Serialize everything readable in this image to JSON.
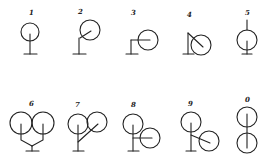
{
  "diagram": {
    "stroke_color": "#222222",
    "background": "#ffffff",
    "figures": [
      {
        "label": "1",
        "row": 1,
        "variant": "single circle, vertical stem from center to base"
      },
      {
        "label": "2",
        "row": 1,
        "variant": "single circle offset upper-right, angled arm to stem"
      },
      {
        "label": "3",
        "row": 1,
        "variant": "single circle offset right, horizontal arm to stem"
      },
      {
        "label": "4",
        "row": 1,
        "variant": "single circle lower-right, diagonal arm from top of stem"
      },
      {
        "label": "5",
        "row": 1,
        "variant": "single circle with stem above and below"
      },
      {
        "label": "6",
        "row": 2,
        "variant": "two circles side by side, Y-shaped stems joining to base"
      },
      {
        "label": "7",
        "row": 2,
        "variant": "two circles, right one on angled arm from main stem"
      },
      {
        "label": "8",
        "row": 2,
        "variant": "two circles, lower-right one on horizontal arm"
      },
      {
        "label": "9",
        "row": 2,
        "variant": "two circles, lower-right one on diagonal arm"
      },
      {
        "label": "0",
        "row": 2,
        "variant": "two circles stacked vertically on shared axis"
      }
    ]
  }
}
